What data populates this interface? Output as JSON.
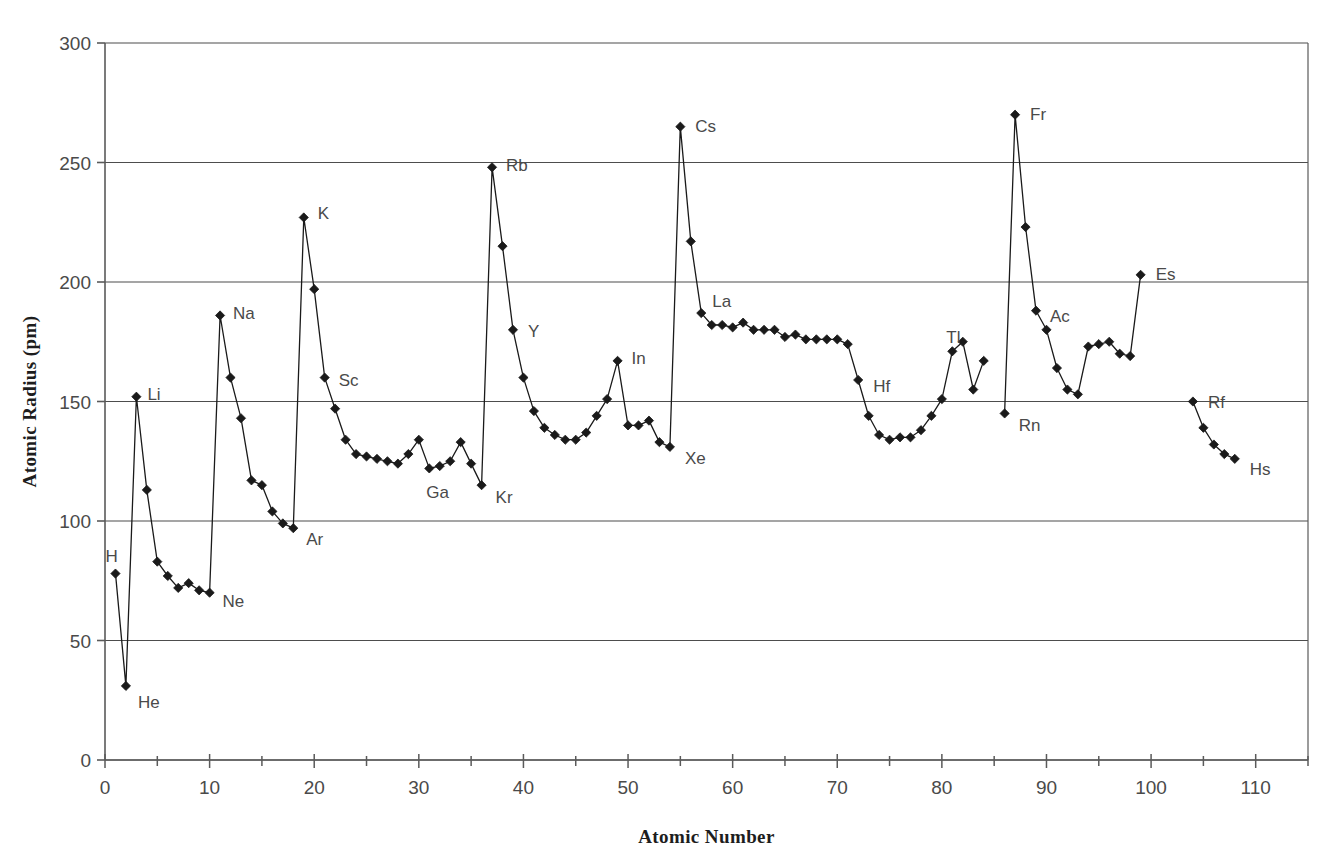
{
  "chart_data": {
    "type": "line",
    "title": "",
    "xlabel": "Atomic Number",
    "ylabel": "Atomic Radius (pm)",
    "xlim": [
      0,
      115
    ],
    "ylim": [
      0,
      300
    ],
    "xticks": [
      0,
      10,
      20,
      30,
      40,
      50,
      60,
      70,
      80,
      90,
      100,
      110
    ],
    "xtick_labels": [
      "0",
      "10",
      "20",
      "30",
      "40",
      "50",
      "60",
      "70",
      "80",
      "90",
      "100",
      "110"
    ],
    "xminor_step": 5,
    "yticks": [
      0,
      50,
      100,
      150,
      200,
      250,
      300
    ],
    "ytick_labels": [
      "0",
      "50",
      "100",
      "150",
      "200",
      "250",
      "300"
    ],
    "grid": "horizontal-major",
    "legend": "none",
    "marker": "diamond",
    "series": [
      {
        "name": "Atomic Radius",
        "color": "#1a1a1a",
        "x": [
          1,
          2,
          3,
          4,
          5,
          6,
          7,
          8,
          9,
          10,
          11,
          12,
          13,
          14,
          15,
          16,
          17,
          18,
          19,
          20,
          21,
          22,
          23,
          24,
          25,
          26,
          27,
          28,
          29,
          30,
          31,
          32,
          33,
          34,
          35,
          36,
          37,
          38,
          39,
          40,
          41,
          42,
          43,
          44,
          45,
          46,
          47,
          48,
          49,
          50,
          51,
          52,
          53,
          54,
          55,
          56,
          57,
          58,
          59,
          60,
          61,
          62,
          63,
          64,
          65,
          66,
          67,
          68,
          69,
          70,
          71,
          72,
          73,
          74,
          75,
          76,
          77,
          78,
          79,
          80,
          81,
          82,
          83,
          84,
          86,
          87,
          88,
          89,
          90,
          91,
          92,
          93,
          94,
          95,
          96,
          97,
          98,
          99,
          104,
          105,
          106,
          107,
          108
        ],
        "values": [
          78,
          31,
          152,
          113,
          83,
          77,
          72,
          74,
          71,
          70,
          186,
          160,
          143,
          117,
          115,
          104,
          99,
          97,
          227,
          197,
          160,
          147,
          134,
          128,
          127,
          126,
          125,
          124,
          128,
          134,
          122,
          123,
          125,
          133,
          124,
          115,
          248,
          215,
          180,
          160,
          146,
          139,
          136,
          134,
          134,
          137,
          144,
          151,
          167,
          140,
          140,
          142,
          133,
          131,
          265,
          217,
          187,
          182,
          182,
          181,
          183,
          180,
          180,
          180,
          177,
          178,
          176,
          176,
          176,
          176,
          174,
          159,
          144,
          136,
          134,
          135,
          135,
          138,
          144,
          151,
          171,
          175,
          155,
          167,
          145,
          270,
          223,
          188,
          180,
          164,
          155,
          153,
          173,
          174,
          175,
          170,
          169,
          203,
          150,
          139,
          132,
          128,
          126
        ]
      }
    ],
    "annotations": [
      {
        "label": "H",
        "x": 1,
        "y": 78,
        "dx": -10,
        "dy": -18
      },
      {
        "label": "He",
        "x": 2,
        "y": 31,
        "dx": 12,
        "dy": 16
      },
      {
        "label": "Li",
        "x": 3,
        "y": 152,
        "dx": 11,
        "dy": -3
      },
      {
        "label": "Ne",
        "x": 10,
        "y": 70,
        "dx": 13,
        "dy": 8
      },
      {
        "label": "Na",
        "x": 11,
        "y": 186,
        "dx": 13,
        "dy": -2
      },
      {
        "label": "Ar",
        "x": 18,
        "y": 97,
        "dx": 13,
        "dy": 11
      },
      {
        "label": "K",
        "x": 19,
        "y": 227,
        "dx": 14,
        "dy": -4
      },
      {
        "label": "Sc",
        "x": 21,
        "y": 160,
        "dx": 14,
        "dy": 2
      },
      {
        "label": "Ga",
        "x": 31,
        "y": 122,
        "dx": -3,
        "dy": 24
      },
      {
        "label": "Kr",
        "x": 36,
        "y": 115,
        "dx": 14,
        "dy": 12
      },
      {
        "label": "Rb",
        "x": 37,
        "y": 248,
        "dx": 14,
        "dy": -2
      },
      {
        "label": "Y",
        "x": 39,
        "y": 180,
        "dx": 15,
        "dy": 1
      },
      {
        "label": "In",
        "x": 49,
        "y": 167,
        "dx": 14,
        "dy": -3
      },
      {
        "label": "Xe",
        "x": 54,
        "y": 131,
        "dx": 15,
        "dy": 11
      },
      {
        "label": "Cs",
        "x": 55,
        "y": 265,
        "dx": 15,
        "dy": -1
      },
      {
        "label": "La",
        "x": 57,
        "y": 187,
        "dx": 11,
        "dy": -12
      },
      {
        "label": "Hf",
        "x": 72,
        "y": 159,
        "dx": 15,
        "dy": 6
      },
      {
        "label": "Tl",
        "x": 81,
        "y": 171,
        "dx": -6,
        "dy": -14
      },
      {
        "label": "Rn",
        "x": 86,
        "y": 145,
        "dx": 14,
        "dy": 12
      },
      {
        "label": "Fr",
        "x": 87,
        "y": 270,
        "dx": 15,
        "dy": -1
      },
      {
        "label": "Ac",
        "x": 89,
        "y": 188,
        "dx": 14,
        "dy": 5
      },
      {
        "label": "Es",
        "x": 99,
        "y": 203,
        "dx": 15,
        "dy": -1
      },
      {
        "label": "Rf",
        "x": 104,
        "y": 150,
        "dx": 15,
        "dy": 0
      },
      {
        "label": "Hs",
        "x": 108,
        "y": 126,
        "dx": 15,
        "dy": 10
      }
    ]
  },
  "axis_colors": {
    "frame": "#5a5a5a",
    "gridline": "#4d4d4d",
    "series": "#1a1a1a",
    "text": "#454545"
  }
}
